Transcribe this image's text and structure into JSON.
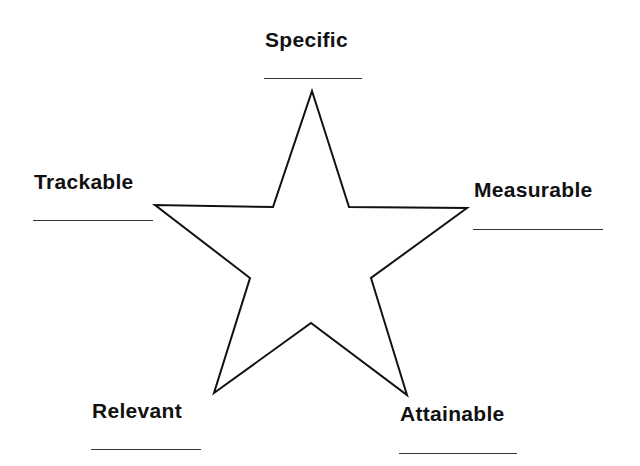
{
  "diagram": {
    "type": "star",
    "points": [
      {
        "label": "Specific",
        "answer_line": ""
      },
      {
        "label": "Measurable",
        "answer_line": ""
      },
      {
        "label": "Attainable",
        "answer_line": ""
      },
      {
        "label": "Relevant",
        "answer_line": ""
      },
      {
        "label": "Trackable",
        "answer_line": ""
      }
    ],
    "colors": {
      "stroke": "#111111",
      "fill": "#ffffff",
      "text": "#111111"
    }
  }
}
